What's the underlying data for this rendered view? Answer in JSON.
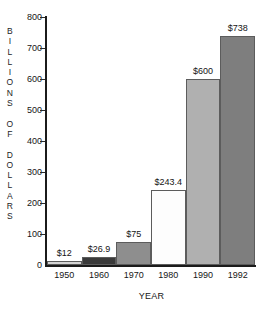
{
  "chart_data": {
    "type": "bar",
    "title": "",
    "xlabel": "YEAR",
    "ylabel": "BILLIONS OF DOLLARS",
    "ylabel_lines": [
      "B",
      "I",
      "L",
      "L",
      "I",
      "O",
      "N",
      "S",
      "",
      "O",
      "F",
      "",
      "D",
      "O",
      "L",
      "L",
      "A",
      "R",
      "S"
    ],
    "categories": [
      "1950",
      "1960",
      "1970",
      "1980",
      "1990",
      "1992"
    ],
    "values": [
      12,
      26.9,
      75,
      243.4,
      600,
      738
    ],
    "value_labels": [
      "$12",
      "$26.9",
      "$75",
      "$243.4",
      "$600",
      "$738"
    ],
    "bar_colors": [
      "#d4d4d4",
      "#3a3a3a",
      "#8e8e8e",
      "#fdfdfd",
      "#b0b0b0",
      "#7e7e7e"
    ],
    "ylim": [
      0,
      800
    ],
    "yticks": [
      0,
      100,
      200,
      300,
      400,
      500,
      600,
      700,
      800
    ],
    "ytick_labels": [
      "0",
      "100",
      "200",
      "300",
      "400",
      "500",
      "600",
      "700",
      "800"
    ],
    "grid": false,
    "legend": false
  }
}
